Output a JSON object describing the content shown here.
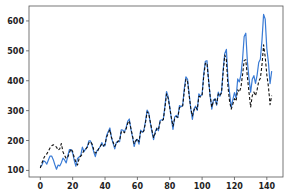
{
  "chart_data": {
    "type": "line",
    "title": "",
    "xlabel": "",
    "ylabel": "",
    "xlim": [
      -7,
      150
    ],
    "ylim": [
      78,
      650
    ],
    "grid": false,
    "legend": null,
    "xticks": [
      0,
      20,
      40,
      60,
      80,
      100,
      120,
      140
    ],
    "yticks": [
      100,
      200,
      300,
      400,
      500,
      600
    ],
    "x": [
      0,
      1,
      2,
      3,
      4,
      5,
      6,
      7,
      8,
      9,
      10,
      11,
      12,
      13,
      14,
      15,
      16,
      17,
      18,
      19,
      20,
      21,
      22,
      23,
      24,
      25,
      26,
      27,
      28,
      29,
      30,
      31,
      32,
      33,
      34,
      35,
      36,
      37,
      38,
      39,
      40,
      41,
      42,
      43,
      44,
      45,
      46,
      47,
      48,
      49,
      50,
      51,
      52,
      53,
      54,
      55,
      56,
      57,
      58,
      59,
      60,
      61,
      62,
      63,
      64,
      65,
      66,
      67,
      68,
      69,
      70,
      71,
      72,
      73,
      74,
      75,
      76,
      77,
      78,
      79,
      80,
      81,
      82,
      83,
      84,
      85,
      86,
      87,
      88,
      89,
      90,
      91,
      92,
      93,
      94,
      95,
      96,
      97,
      98,
      99,
      100,
      101,
      102,
      103,
      104,
      105,
      106,
      107,
      108,
      109,
      110,
      111,
      112,
      113,
      114,
      115,
      116,
      117,
      118,
      119,
      120,
      121,
      122,
      123,
      124,
      125,
      126,
      127,
      128,
      129,
      130,
      131,
      132,
      133,
      134,
      135,
      136,
      137,
      138,
      139,
      140,
      141,
      142,
      143
    ],
    "series": [
      {
        "name": "actual",
        "color": "#3a7bd5",
        "style": "solid",
        "values": [
          112,
          118,
          132,
          129,
          121,
          135,
          148,
          148,
          136,
          119,
          104,
          118,
          115,
          126,
          141,
          135,
          125,
          149,
          170,
          170,
          158,
          133,
          114,
          140,
          145,
          150,
          178,
          163,
          172,
          178,
          199,
          199,
          184,
          162,
          146,
          166,
          171,
          180,
          193,
          181,
          183,
          218,
          230,
          242,
          209,
          191,
          172,
          194,
          196,
          196,
          236,
          235,
          229,
          243,
          264,
          272,
          237,
          211,
          180,
          201,
          204,
          188,
          235,
          227,
          234,
          264,
          302,
          293,
          259,
          229,
          203,
          229,
          242,
          233,
          267,
          269,
          270,
          315,
          364,
          347,
          312,
          274,
          237,
          278,
          284,
          277,
          317,
          313,
          318,
          374,
          413,
          405,
          355,
          306,
          271,
          306,
          315,
          301,
          356,
          348,
          355,
          422,
          465,
          467,
          404,
          347,
          305,
          336,
          340,
          318,
          362,
          348,
          363,
          435,
          491,
          505,
          404,
          359,
          310,
          337,
          360,
          342,
          406,
          396,
          420,
          472,
          548,
          559,
          463,
          407,
          362,
          405,
          417,
          391,
          419,
          461,
          472,
          535,
          622,
          606,
          508,
          461,
          390,
          432
        ]
      },
      {
        "name": "predicted",
        "color": "#111111",
        "style": "dashed",
        "values": [
          108,
          125,
          140,
          150,
          155,
          165,
          175,
          182,
          186,
          183,
          178,
          168,
          172,
          190,
          162,
          150,
          140,
          145,
          160,
          172,
          163,
          142,
          128,
          118,
          140,
          148,
          155,
          168,
          170,
          178,
          192,
          196,
          188,
          170,
          158,
          160,
          172,
          180,
          188,
          182,
          188,
          212,
          224,
          236,
          210,
          194,
          180,
          190,
          198,
          200,
          228,
          232,
          226,
          238,
          258,
          266,
          240,
          215,
          190,
          198,
          206,
          196,
          230,
          226,
          232,
          260,
          296,
          290,
          262,
          234,
          210,
          224,
          240,
          236,
          262,
          266,
          270,
          308,
          356,
          342,
          310,
          276,
          248,
          272,
          280,
          278,
          310,
          312,
          316,
          366,
          405,
          398,
          350,
          308,
          282,
          302,
          312,
          304,
          348,
          346,
          352,
          415,
          458,
          460,
          400,
          348,
          312,
          332,
          338,
          322,
          356,
          350,
          360,
          428,
          486,
          470,
          380,
          330,
          305,
          322,
          340,
          332,
          370,
          362,
          378,
          420,
          468,
          470,
          412,
          360,
          312,
          350,
          362,
          350,
          370,
          398,
          408,
          452,
          520,
          480,
          420,
          380,
          320,
          350
        ]
      }
    ]
  }
}
